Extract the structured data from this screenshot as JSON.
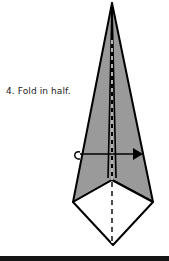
{
  "step": {
    "number": "4",
    "label": "4. Fold in half."
  },
  "diagram": {
    "fill_color": "#9a9a9a",
    "line_color": "#000000",
    "paper_color": "#ffffff",
    "icons": [
      "kite-fold-shape",
      "valley-fold-line",
      "fold-arrow"
    ]
  },
  "footer": {
    "bar_color": "#151515"
  }
}
